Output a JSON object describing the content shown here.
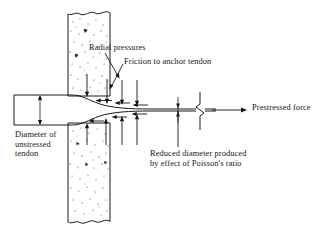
{
  "figure": {
    "kind": "engineering-diagram",
    "background_color": "#ffffff",
    "ink_color": "#161616"
  },
  "labels": {
    "radial_pressures": "Radial pressures",
    "friction": "Friction to anchor tendon",
    "prestressed_force": "Prestressed force",
    "diameter_unstressed_line1": "Diameter of",
    "diameter_unstressed_line2": "unstressed",
    "diameter_unstressed_line3": "tendon",
    "reduced_diameter_line1": "Reduced diameter produced",
    "reduced_diameter_line2": "by effect of Poisson's ratio"
  },
  "parts": {
    "concrete_block": "concrete-anchorage-block",
    "tendon": "prestressing-tendon",
    "break_symbol": "break-symbol",
    "unstressed_diameter_dimension": "unstressed-diameter-dimension",
    "reduced_diameter_dimension": "reduced-diameter-dimension"
  },
  "arrows": {
    "radial_top_count": 4,
    "radial_bottom_count": 4,
    "friction_top_count": 3,
    "friction_bottom_count": 3,
    "radial_top_direction": "down",
    "radial_bottom_direction": "up",
    "friction_direction": "left",
    "prestressed_force_direction": "right"
  }
}
